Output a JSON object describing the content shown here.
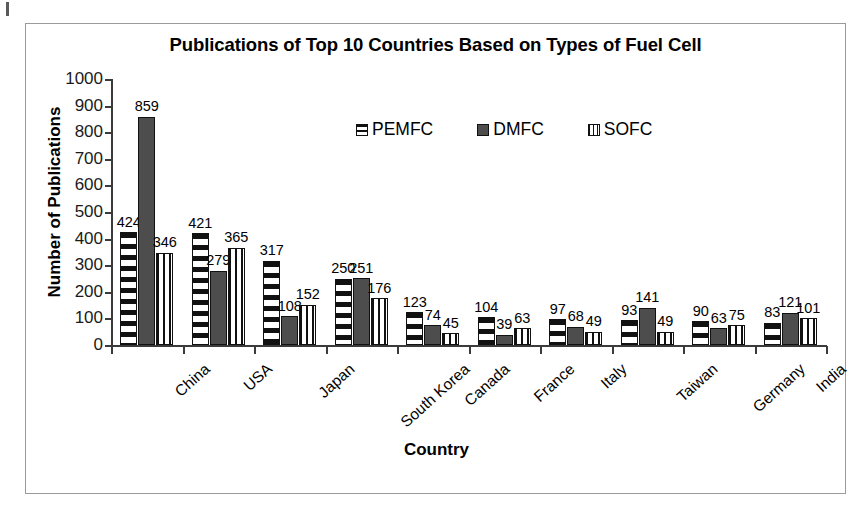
{
  "chart_data": {
    "type": "bar",
    "title": "Publications of Top 10 Countries Based on Types of Fuel Cell",
    "xlabel": "Country",
    "ylabel": "Number of Publications",
    "categories": [
      "China",
      "USA",
      "Japan",
      "South Korea",
      "Canada",
      "France",
      "Italy",
      "Taiwan",
      "Germany",
      "India"
    ],
    "series": [
      {
        "name": "PEMFC",
        "pattern": "horizontal-stripes",
        "values": [
          424,
          421,
          317,
          250,
          123,
          104,
          97,
          93,
          90,
          83
        ]
      },
      {
        "name": "DMFC",
        "pattern": "solid-dark-gray",
        "values": [
          859,
          279,
          108,
          251,
          74,
          39,
          68,
          141,
          63,
          121
        ]
      },
      {
        "name": "SOFC",
        "pattern": "vertical-stripes",
        "values": [
          346,
          365,
          152,
          176,
          45,
          63,
          49,
          49,
          75,
          101
        ]
      }
    ],
    "ylim": [
      0,
      1000
    ],
    "y_ticks": [
      0,
      100,
      200,
      300,
      400,
      500,
      600,
      700,
      800,
      900,
      1000
    ],
    "grid": false,
    "legend_position": "top-center",
    "data_labels": true
  },
  "legend": {
    "items": [
      {
        "label": "PEMFC"
      },
      {
        "label": "DMFC"
      },
      {
        "label": "SOFC"
      }
    ]
  },
  "colors": {
    "pemfc": "#111111",
    "dmfc": "#4d4d4d",
    "sofc": "#111111",
    "axis": "#3b3b3b",
    "frame": "#9b9b9b",
    "background": "#ffffff"
  }
}
